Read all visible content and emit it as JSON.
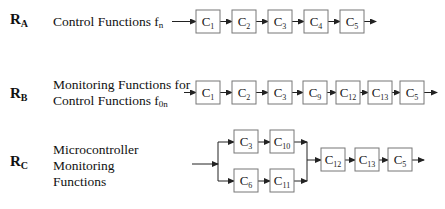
{
  "rows": [
    {
      "id": "RA",
      "label_main": "R",
      "label_sub": "A",
      "description_lines": [
        "Control Functions f"
      ],
      "description_sub": "n",
      "components": [
        {
          "main": "C",
          "sub": "1"
        },
        {
          "main": "C",
          "sub": "2"
        },
        {
          "main": "C",
          "sub": "3"
        },
        {
          "main": "C",
          "sub": "4"
        },
        {
          "main": "C",
          "sub": "5"
        }
      ]
    },
    {
      "id": "RB",
      "label_main": "R",
      "label_sub": "B",
      "description_lines": [
        "Monitoring Functions for",
        "Control Functions f"
      ],
      "description_sub": "0n",
      "components": [
        {
          "main": "C",
          "sub": "1"
        },
        {
          "main": "C",
          "sub": "2"
        },
        {
          "main": "C",
          "sub": "3"
        },
        {
          "main": "C",
          "sub": "9"
        },
        {
          "main": "C",
          "sub": "12"
        },
        {
          "main": "C",
          "sub": "13"
        },
        {
          "main": "C",
          "sub": "5"
        }
      ]
    },
    {
      "id": "RC",
      "label_main": "R",
      "label_sub": "C",
      "description_lines": [
        "Microcontroller",
        "Monitoring",
        "Functions"
      ],
      "upper_branch": [
        {
          "main": "C",
          "sub": "3"
        },
        {
          "main": "C",
          "sub": "10"
        }
      ],
      "lower_branch": [
        {
          "main": "C",
          "sub": "6"
        },
        {
          "main": "C",
          "sub": "11"
        }
      ],
      "merged": [
        {
          "main": "C",
          "sub": "12"
        },
        {
          "main": "C",
          "sub": "13"
        },
        {
          "main": "C",
          "sub": "5"
        }
      ]
    }
  ],
  "colors": {
    "box_stroke": "#777777",
    "line": "#222222",
    "text": "#111111"
  }
}
